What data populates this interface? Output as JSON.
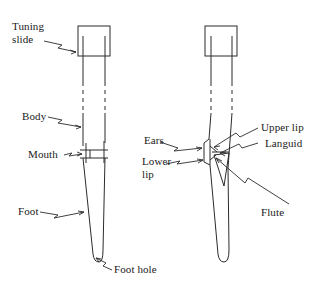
{
  "figure": {
    "line_color": "#2b2b2b",
    "text_color": "#1a1a1a",
    "background": "#ffffff"
  },
  "labels": {
    "tuning_slide": "Tuning\nslide",
    "body": "Body",
    "mouth": "Mouth",
    "foot": "Foot",
    "foot_hole": "Foot hole",
    "ears": "Ears",
    "lower_lip": "Lower\nlip",
    "upper_lip": "Upper lip",
    "languid": "Languid",
    "flute": "Flute"
  },
  "pipes": {
    "left": {
      "name": "whole-pipe-overview",
      "parts": [
        "Tuning slide",
        "Body",
        "Mouth",
        "Foot",
        "Foot hole"
      ]
    },
    "right": {
      "name": "pipe-mouth-detail",
      "parts": [
        "Ears",
        "Lower lip",
        "Upper lip",
        "Languid",
        "Flute"
      ]
    }
  }
}
